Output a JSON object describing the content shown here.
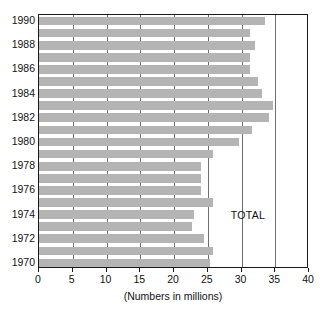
{
  "chart_data": {
    "type": "bar",
    "orientation": "horizontal",
    "title": "",
    "subtitle": "",
    "xlabel": "(Numbers in millions)",
    "ylabel": "",
    "xlim": [
      0,
      40
    ],
    "xticks": [
      0,
      5,
      10,
      15,
      20,
      25,
      30,
      35,
      40
    ],
    "xticklabels": [
      "0",
      "5",
      "10",
      "15",
      "20",
      "25",
      "30",
      "35",
      "40"
    ],
    "grid": "vertical",
    "legend": "none",
    "bar_color": "#b4b4b4",
    "axis_color": "#1a1a1a",
    "annotations": [
      {
        "text": "TOTAL",
        "x": 31,
        "y": 1974
      }
    ],
    "categories": [
      "1990",
      "1989",
      "1988",
      "1987",
      "1986",
      "1985",
      "1984",
      "1983",
      "1982",
      "1981",
      "1980",
      "1979",
      "1978",
      "1977",
      "1976",
      "1975",
      "1974",
      "1973",
      "1972",
      "1971",
      "1970"
    ],
    "values": [
      33.5,
      31.2,
      32.0,
      31.3,
      31.2,
      32.5,
      33.0,
      34.7,
      34.0,
      31.5,
      29.6,
      25.8,
      24.0,
      24.0,
      24.0,
      25.8,
      23.0,
      22.6,
      24.4,
      25.8,
      25.3
    ],
    "yticklabels": [
      "1990",
      "1988",
      "1986",
      "1984",
      "1982",
      "1980",
      "1978",
      "1976",
      "1974",
      "1972",
      "1970"
    ]
  }
}
